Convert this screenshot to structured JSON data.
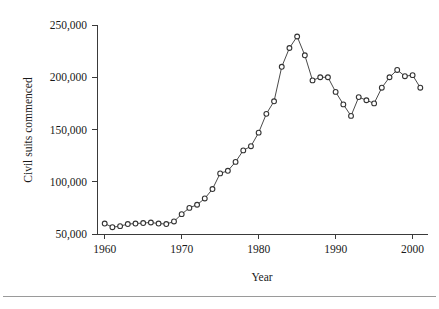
{
  "figure": {
    "background_color": "#ffffff",
    "line_color": "#4a4a4a",
    "marker_fill": "#ffffff",
    "marker_stroke": "#333333",
    "axis_color": "#3a3a3a",
    "rule_color": "#9a9a9a"
  },
  "chart_data": {
    "type": "line",
    "title": "",
    "xlabel": "Year",
    "ylabel": "Civil suits commenced",
    "xlim": [
      1959,
      2002
    ],
    "ylim": [
      50000,
      250000
    ],
    "xticks": [
      1960,
      1970,
      1980,
      1990,
      2000
    ],
    "xtick_labels": [
      "1960",
      "1970",
      "1980",
      "1990",
      "2000"
    ],
    "yticks": [
      50000,
      100000,
      150000,
      200000,
      250000
    ],
    "ytick_labels": [
      "50,000",
      "100,000",
      "150,000",
      "200,000",
      "250,000"
    ],
    "grid": false,
    "legend": false,
    "marker": "open-circle",
    "series": [
      {
        "name": "Civil suits commenced",
        "x": [
          1960,
          1961,
          1962,
          1963,
          1964,
          1965,
          1966,
          1967,
          1968,
          1969,
          1970,
          1971,
          1972,
          1973,
          1974,
          1975,
          1976,
          1977,
          1978,
          1979,
          1980,
          1981,
          1982,
          1983,
          1984,
          1985,
          1986,
          1987,
          1988,
          1989,
          1990,
          1991,
          1992,
          1993,
          1994,
          1995,
          1996,
          1997,
          1998,
          1999,
          2000,
          2001
        ],
        "values": [
          60000,
          56500,
          57500,
          59500,
          60000,
          60500,
          61000,
          60000,
          59500,
          62000,
          69000,
          75000,
          78000,
          84000,
          93000,
          108000,
          110500,
          119000,
          130000,
          134000,
          147000,
          165000,
          177000,
          210000,
          228000,
          239000,
          221000,
          197000,
          200000,
          200000,
          186000,
          174000,
          163000,
          181000,
          178000,
          175000,
          190000,
          200000,
          207000,
          201000,
          202000,
          190000
        ]
      }
    ]
  },
  "axes": {
    "x_axis_label": "Year",
    "y_axis_label": "Civil suits commenced"
  }
}
